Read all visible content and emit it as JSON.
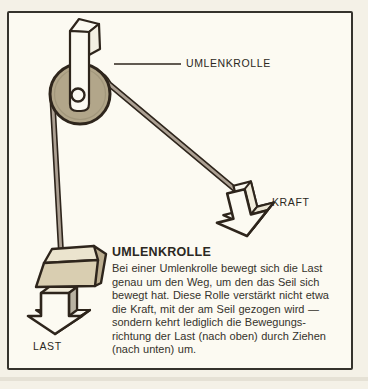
{
  "labels": {
    "pulley": "UMLENKROLLE",
    "force": "KRAFT",
    "load": "LAST"
  },
  "caption": {
    "title": "UMLENKROLLE",
    "body": "Bei einer Umlenkrolle bewegt sich die Last\ngenau um den Weg, um den das Seil sich\nbewegt hat. Diese Rolle verstärkt nicht etwa\ndie Kraft, mit der am Seil gezogen wird —\nsondern kehrt lediglich die Bewegungs-\nrichtung der Last (nach oben) durch Ziehen\n(nach unten) um."
  },
  "colors": {
    "ink": "#2e251c",
    "paper": "#fcfaf2",
    "page_margin": "#f4f1e7",
    "wheel_fill": "#b2a68a",
    "rope_core": "#aca093",
    "weight_front": "#d9ceb1",
    "weight_top": "#ebe4ce",
    "weight_side": "#bcae90",
    "arrow_side_gray": "#c2bcae",
    "box_side_gray": "#b9b2a2",
    "white_face": "#fcfaf2"
  }
}
